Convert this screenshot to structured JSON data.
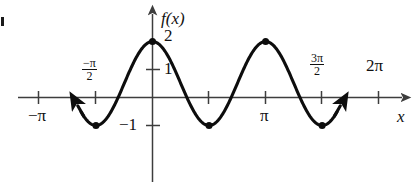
{
  "figure": {
    "marker": "▪",
    "axis": {
      "y_axis_label": "f(x)",
      "x_axis_label": "x"
    },
    "x_ticks_above": [
      {
        "key": "neg_half_pi",
        "numerator": "−π",
        "denominator": "2",
        "leading": ""
      },
      {
        "key": "three_half_pi",
        "numerator": "3π",
        "denominator": "2",
        "leading": ""
      }
    ],
    "x_ticks_below": [
      {
        "key": "neg_pi",
        "label": "−π"
      },
      {
        "key": "pi",
        "label": "π"
      }
    ],
    "x_ticks_plain": [
      {
        "key": "two_pi",
        "label": "2π"
      }
    ],
    "y_ticks": [
      {
        "key": "two",
        "label": "2"
      },
      {
        "key": "one",
        "label": "1"
      },
      {
        "key": "neg_one",
        "label": "−1"
      }
    ]
  },
  "chart_data": {
    "type": "line",
    "title": "",
    "xlabel": "x",
    "ylabel": "f(x)",
    "xlim": [
      -3.4557519189487724,
      7.0685834705770345
    ],
    "ylim": [
      -2.0,
      2.6
    ],
    "grid": false,
    "legend": null,
    "x_tick_values": [
      -3.141592653589793,
      -1.5707963267948966,
      0,
      1.5707963267948966,
      3.141592653589793,
      4.71238898038469,
      6.283185307179586
    ],
    "x_tick_labels": [
      "−π",
      "−π/2",
      "",
      "",
      "π",
      "3π/2",
      "2π"
    ],
    "y_tick_values": [
      -1,
      1,
      2
    ],
    "y_tick_labels": [
      "−1",
      "1",
      "2"
    ],
    "function": "f(x) = 0.5 + 1.5·cos(2x)",
    "amplitude": 1.5,
    "midline": 0.5,
    "period": 3.141592653589793,
    "maximum": 2,
    "minimum": -1,
    "domain_drawn": [
      -2.0943951023931953,
      5.235987755982989
    ],
    "series": [
      {
        "name": "f",
        "x": [
          -2.0943951023931953,
          -1.9634954084936207,
          -1.832595714594046,
          -1.7016960206944713,
          -1.5707963267948966,
          -1.4398966328953218,
          -1.3089969389957472,
          -1.1780972450961724,
          -1.0471975511965976,
          -0.916297857297023,
          -0.7853981633974483,
          -0.6544984694978736,
          -0.5235987755982988,
          -0.39269908169872414,
          -0.2617993877991494,
          -0.1308996938995747,
          0,
          0.1308996938995747,
          0.2617993877991494,
          0.39269908169872414,
          0.5235987755982988,
          0.6544984694978736,
          0.7853981633974483,
          0.916297857297023,
          1.0471975511965976,
          1.1780972450961724,
          1.3089969389957472,
          1.4398966328953218,
          1.5707963267948966,
          1.7016960206944713,
          1.832595714594046,
          1.9634954084936207,
          2.0943951023931953,
          2.2252947962927703,
          2.356194490192345,
          2.4870941840919194,
          2.6179938779914944,
          2.748893571891069,
          2.8797932657906435,
          3.010692959690118,
          3.141592653589793,
          3.2724923474893677,
          3.4033920413889422,
          3.5342917352885173,
          3.665191429188092,
          3.7960911230876673,
          3.9269908169872414,
          4.057890510886816,
          4.188790204786391,
          4.319689898685965,
          4.45058959258554,
          4.581489286485115,
          4.71238898038469,
          4.843288674284264,
          4.974188368183839,
          5.105088062083414,
          5.235987755982989
        ],
        "y": [
          -0.25,
          -0.3492077864655,
          -0.5,
          -0.6939234487262,
          -0.9142135623731,
          -1.0,
          -0.9142135623731,
          -0.6939234487262,
          -0.5,
          -0.3492077864655,
          -0.25,
          0.0490381056767,
          0.25,
          0.5,
          0.8,
          1.1,
          2.0,
          1.1,
          0.8,
          0.5,
          0.25,
          0.0490381056767,
          -0.25,
          -0.3492077864655,
          -0.5,
          -0.6939234487262,
          -0.9142135623731,
          -1.0,
          -0.9142135623731,
          -0.6939234487262,
          -0.5,
          -0.3492077864655,
          -0.25,
          0.0490381056767,
          0.25,
          0.5,
          0.8,
          1.1,
          1.5,
          1.8,
          2.0,
          1.8,
          1.5,
          1.1,
          0.8,
          0.5,
          0.25,
          0.0490381056767,
          -0.25,
          -0.3492077864655,
          -0.5,
          -0.6939234487262,
          -1.0,
          -0.9142135623731,
          -0.6939234487262,
          -0.5,
          -0.25
        ]
      }
    ],
    "marked_points": [
      {
        "x": -1.5707963267948966,
        "y": -1,
        "kind": "minimum"
      },
      {
        "x": 0,
        "y": 2,
        "kind": "maximum"
      },
      {
        "x": 1.5707963267948966,
        "y": -1,
        "kind": "minimum"
      },
      {
        "x": 3.141592653589793,
        "y": 2,
        "kind": "maximum"
      },
      {
        "x": 4.71238898038469,
        "y": -1,
        "kind": "minimum"
      }
    ],
    "end_arrows": [
      "start",
      "end"
    ]
  }
}
